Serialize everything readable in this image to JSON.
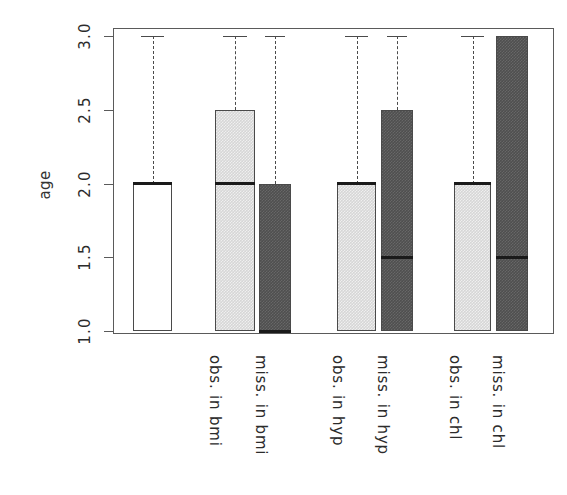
{
  "figure": {
    "type": "boxplot-figure",
    "background": "#ffffff"
  },
  "axes": {
    "y_title": "age",
    "y_ticks": [
      "1.0",
      "1.5",
      "2.0",
      "2.5",
      "3.0"
    ],
    "x_tick_labels": [
      "",
      "obs. in bmi",
      "miss. in bmi",
      "obs. in hyp",
      "miss. in hyp",
      "obs. in chl",
      "miss. in chl"
    ]
  },
  "colors": {
    "box_white": "#ffffff",
    "box_light_gray": "#d6d6d6",
    "box_dark_gray": "#4f4f4f",
    "border": "#4a4a4a",
    "frame": "#5a5a5a",
    "median": "#1a1a1a",
    "text": "#2b2b2b"
  },
  "chart_data": {
    "type": "boxplot",
    "title": "",
    "xlabel": "",
    "ylabel": "age",
    "ylim": [
      1.0,
      3.0
    ],
    "yticks": [
      1.0,
      1.5,
      2.0,
      2.5,
      3.0
    ],
    "grid": false,
    "legend": "none",
    "categories": [
      "all",
      "obs. in bmi",
      "miss. in bmi",
      "obs. in hyp",
      "miss. in hyp",
      "obs. in chl",
      "miss. in chl"
    ],
    "boxes": [
      {
        "label": "all",
        "fill": "white",
        "q1": 1.0,
        "median": 2.0,
        "q3": 2.0,
        "whisker_low": 1.0,
        "whisker_high": 3.0,
        "has_upper_whisker": true,
        "has_lower_whisker": false
      },
      {
        "label": "obs. in bmi",
        "fill": "light-gray",
        "q1": 1.0,
        "median": 2.0,
        "q3": 2.5,
        "whisker_low": 1.0,
        "whisker_high": 3.0,
        "has_upper_whisker": true,
        "has_lower_whisker": false
      },
      {
        "label": "miss. in bmi",
        "fill": "dark-gray",
        "q1": 1.0,
        "median": 1.0,
        "q3": 2.0,
        "whisker_low": 1.0,
        "whisker_high": 3.0,
        "has_upper_whisker": true,
        "has_lower_whisker": false
      },
      {
        "label": "obs. in hyp",
        "fill": "light-gray",
        "q1": 1.0,
        "median": 2.0,
        "q3": 2.0,
        "whisker_low": 1.0,
        "whisker_high": 3.0,
        "has_upper_whisker": true,
        "has_lower_whisker": false
      },
      {
        "label": "miss. in hyp",
        "fill": "dark-gray",
        "q1": 1.0,
        "median": 1.5,
        "q3": 2.5,
        "whisker_low": 1.0,
        "whisker_high": 3.0,
        "has_upper_whisker": true,
        "has_lower_whisker": false
      },
      {
        "label": "obs. in chl",
        "fill": "light-gray",
        "q1": 1.0,
        "median": 2.0,
        "q3": 2.0,
        "whisker_low": 1.0,
        "whisker_high": 3.0,
        "has_upper_whisker": true,
        "has_lower_whisker": false
      },
      {
        "label": "miss. in chl",
        "fill": "dark-gray",
        "q1": 1.0,
        "median": 1.5,
        "q3": 3.0,
        "whisker_low": 1.0,
        "whisker_high": 3.0,
        "has_upper_whisker": false,
        "has_lower_whisker": false
      }
    ]
  },
  "geometry": {
    "plot": {
      "left": 113,
      "top": 28,
      "width": 441,
      "height": 306
    },
    "y_axis": {
      "top_px": 36,
      "bottom_px": 331,
      "top_val": 3.0,
      "bottom_val": 1.0
    },
    "box_x": [
      {
        "left": 133,
        "width": 39
      },
      {
        "left": 215,
        "width": 40
      },
      {
        "left": 259,
        "width": 32
      },
      {
        "left": 337,
        "width": 39
      },
      {
        "left": 381,
        "width": 32
      },
      {
        "left": 454,
        "width": 37
      },
      {
        "left": 496,
        "width": 32
      }
    ],
    "label_x": [
      0,
      224,
      270,
      347,
      392,
      464,
      507
    ]
  }
}
